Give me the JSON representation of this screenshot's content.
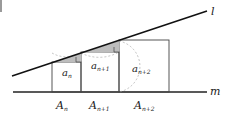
{
  "diagram": {
    "lines": {
      "l_label": "l",
      "m_label": "m"
    },
    "squares": [
      {
        "side_label_main": "a",
        "side_label_sub": "n",
        "base_label_main": "A",
        "base_label_sub": "n"
      },
      {
        "side_label_main": "a",
        "side_label_sub": "n+1",
        "base_label_main": "A",
        "base_label_sub": "n+1"
      },
      {
        "side_label_main": "a",
        "side_label_sub": "n+2",
        "base_label_main": "A",
        "base_label_sub": "n+2"
      }
    ],
    "colors": {
      "stroke": "#333333",
      "line": "#111111",
      "shade": "#b8b8b8",
      "arc": "#999999"
    }
  }
}
